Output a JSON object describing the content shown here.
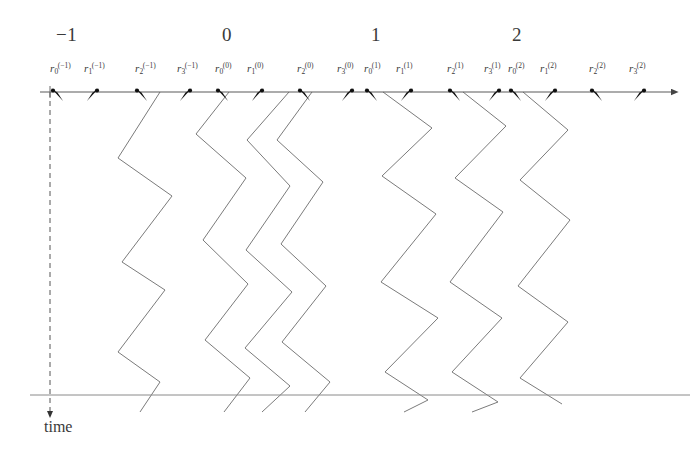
{
  "figure": {
    "kind": "space-time-trajectory-diagram",
    "time_axis_label": "time",
    "axis_color": "#555555",
    "trajectory_color": "#777777",
    "label_color": "#3a3a3a",
    "background_color": "#ffffff",
    "horizontal_axis": {
      "x1": 40,
      "x2": 672,
      "y": 92,
      "has_arrow_right": true
    },
    "bottom_axis": {
      "x1": 30,
      "x2": 690,
      "y": 395
    },
    "time_axis": {
      "x": 50,
      "y1": 92,
      "y2": 412,
      "dashed": true,
      "has_arrow_down": true
    },
    "group_numbers": [
      {
        "text": "−1",
        "x": 56,
        "y": 24
      },
      {
        "text": "0",
        "x": 222,
        "y": 24
      },
      {
        "text": "1",
        "x": 371,
        "y": 24
      },
      {
        "text": "2",
        "x": 512,
        "y": 24
      }
    ],
    "tick_labels": [
      {
        "base": "r",
        "sub": "0",
        "sup": "(−1)",
        "x": 50,
        "y": 61
      },
      {
        "base": "r",
        "sub": "1",
        "sup": "(−1)",
        "x": 84,
        "y": 61
      },
      {
        "base": "r",
        "sub": "2",
        "sup": "(−1)",
        "x": 135,
        "y": 61
      },
      {
        "base": "r",
        "sub": "3",
        "sup": "(−1)",
        "x": 177,
        "y": 61
      },
      {
        "base": "r",
        "sub": "0",
        "sup": "(0)",
        "x": 215,
        "y": 61
      },
      {
        "base": "r",
        "sub": "1",
        "sup": "(0)",
        "x": 247,
        "y": 61
      },
      {
        "base": "r",
        "sub": "2",
        "sup": "(0)",
        "x": 297,
        "y": 61
      },
      {
        "base": "r",
        "sub": "3",
        "sup": "(0)",
        "x": 337,
        "y": 61
      },
      {
        "base": "r",
        "sub": "0",
        "sup": "(1)",
        "x": 364,
        "y": 61
      },
      {
        "base": "r",
        "sub": "1",
        "sup": "(1)",
        "x": 396,
        "y": 61
      },
      {
        "base": "r",
        "sub": "2",
        "sup": "(1)",
        "x": 447,
        "y": 61
      },
      {
        "base": "r",
        "sub": "3",
        "sup": "(1)",
        "x": 484,
        "y": 61
      },
      {
        "base": "r",
        "sub": "0",
        "sup": "(2)",
        "x": 508,
        "y": 61
      },
      {
        "base": "r",
        "sub": "1",
        "sup": "(2)",
        "x": 540,
        "y": 61
      },
      {
        "base": "r",
        "sub": "2",
        "sup": "(2)",
        "x": 589,
        "y": 61
      },
      {
        "base": "r",
        "sub": "3",
        "sup": "(2)",
        "x": 629,
        "y": 61
      }
    ],
    "tick_marks": [
      {
        "x": 59,
        "dir": "right-down"
      },
      {
        "x": 91,
        "dir": "left-down"
      },
      {
        "x": 143,
        "dir": "right-down"
      },
      {
        "x": 184,
        "dir": "left-down"
      },
      {
        "x": 224,
        "dir": "right-down"
      },
      {
        "x": 256,
        "dir": "left-down"
      },
      {
        "x": 306,
        "dir": "right-down"
      },
      {
        "x": 346,
        "dir": "left-down"
      },
      {
        "x": 373,
        "dir": "right-down"
      },
      {
        "x": 405,
        "dir": "left-down"
      },
      {
        "x": 456,
        "dir": "right-down"
      },
      {
        "x": 493,
        "dir": "left-down"
      },
      {
        "x": 517,
        "dir": "right-down"
      },
      {
        "x": 549,
        "dir": "left-down"
      },
      {
        "x": 598,
        "dir": "right-down"
      },
      {
        "x": 638,
        "dir": "left-down"
      }
    ],
    "trajectories": [
      {
        "name": "trajectory-1",
        "points": "160,92 118,158 172,196 122,262 165,290 118,352 160,382 140,412"
      },
      {
        "name": "trajectory-2",
        "points": "229,92 196,134 246,178 203,240 248,284 205,340 250,378 224,412"
      },
      {
        "name": "trajectory-3",
        "points": "312,92 277,140 323,182 281,244 326,286 282,342 330,382 305,412"
      },
      {
        "name": "trajectory-4",
        "points": "383,92 432,128 382,176 436,214 381,282 438,318 385,372 428,400 404,412"
      },
      {
        "name": "trajectory-5",
        "points": "463,92 506,126 455,178 503,212 450,282 502,318 452,372 498,402 472,412"
      },
      {
        "name": "trajectory-6",
        "points": "523,92 568,130 520,180 570,220 518,286 568,322 520,378 562,404"
      },
      {
        "name": "trajectory-7",
        "points": "289,92 247,140 290,186 246,250 292,292 245,348 290,386 262,412"
      }
    ]
  }
}
